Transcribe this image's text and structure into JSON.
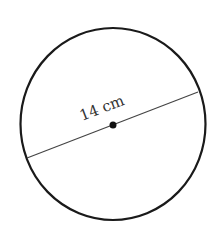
{
  "diagram": {
    "shape": "circle",
    "diameter_label": "14 cm",
    "colors": {
      "stroke": "#1a1a1a",
      "line": "#444444",
      "text": "#333333",
      "background": "#ffffff"
    }
  }
}
